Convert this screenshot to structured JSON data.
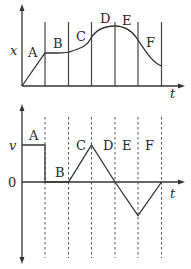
{
  "top_graph": {
    "y_axis_label": "x",
    "x_axis_label": "t",
    "segment_labels": [
      "A",
      "B",
      "C",
      "D",
      "E",
      "F"
    ]
  },
  "bottom_graph": {
    "y_axis_label": "v",
    "x_axis_label": "t",
    "zero_label": "0",
    "segment_labels": [
      "A",
      "B",
      "C",
      "D",
      "E",
      "F"
    ]
  },
  "colors": {
    "line": "#333333",
    "background": "#ffffff"
  }
}
